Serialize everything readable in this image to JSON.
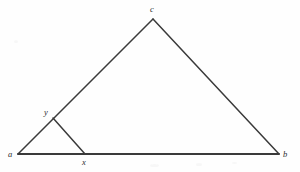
{
  "figure": {
    "kind": "geometry-diagram",
    "canvas": {
      "width": 300,
      "height": 172
    },
    "background_color": "#fefefe",
    "stroke_color": "#3a3a3a",
    "label_color": "#2c2c2c",
    "points": [
      {
        "id": "a",
        "label": "a",
        "x": 18,
        "y": 154,
        "label_x": 8,
        "label_y": 150,
        "role": "triangle-vertex"
      },
      {
        "id": "b",
        "label": "b",
        "x": 279,
        "y": 154,
        "label_x": 283,
        "label_y": 150,
        "role": "triangle-vertex"
      },
      {
        "id": "c",
        "label": "c",
        "x": 153,
        "y": 19,
        "label_x": 150,
        "label_y": 5,
        "role": "triangle-apex"
      },
      {
        "id": "x",
        "label": "x",
        "x": 85,
        "y": 154,
        "label_x": 82,
        "label_y": 158,
        "role": "point-on-base"
      },
      {
        "id": "y",
        "label": "y",
        "x": 53,
        "y": 118,
        "label_x": 44,
        "label_y": 108,
        "role": "point-on-side"
      }
    ],
    "segments": [
      {
        "id": "ab",
        "from": "a",
        "to": "b",
        "x1": 18,
        "y1": 154,
        "x2": 279,
        "y2": 154,
        "width": 1.9
      },
      {
        "id": "ac",
        "from": "a",
        "to": "c",
        "x1": 18,
        "y1": 154,
        "x2": 153,
        "y2": 19,
        "width": 1.5
      },
      {
        "id": "cb",
        "from": "c",
        "to": "b",
        "x1": 153,
        "y1": 19,
        "x2": 279,
        "y2": 154,
        "width": 1.5
      },
      {
        "id": "yx",
        "from": "y",
        "to": "x",
        "x1": 53,
        "y1": 118,
        "x2": 85,
        "y2": 154,
        "width": 1.5
      }
    ]
  }
}
